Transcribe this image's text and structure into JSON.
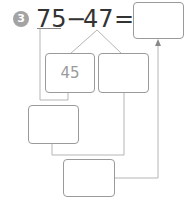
{
  "problem": {
    "number": "3",
    "minuend": "75",
    "operator": "−",
    "subtrahend": "47",
    "equals": "=",
    "answer": ""
  },
  "diagram": {
    "boxes": [
      {
        "id": "split-box-left",
        "value": "45"
      },
      {
        "id": "split-box-right",
        "value": ""
      },
      {
        "id": "step-box-1",
        "value": ""
      },
      {
        "id": "step-box-2",
        "value": ""
      }
    ]
  },
  "colors": {
    "circle": "#a3a3a3",
    "lines": "#b5b5b5",
    "box_border": "#9a9a9a",
    "text": "#333333"
  }
}
